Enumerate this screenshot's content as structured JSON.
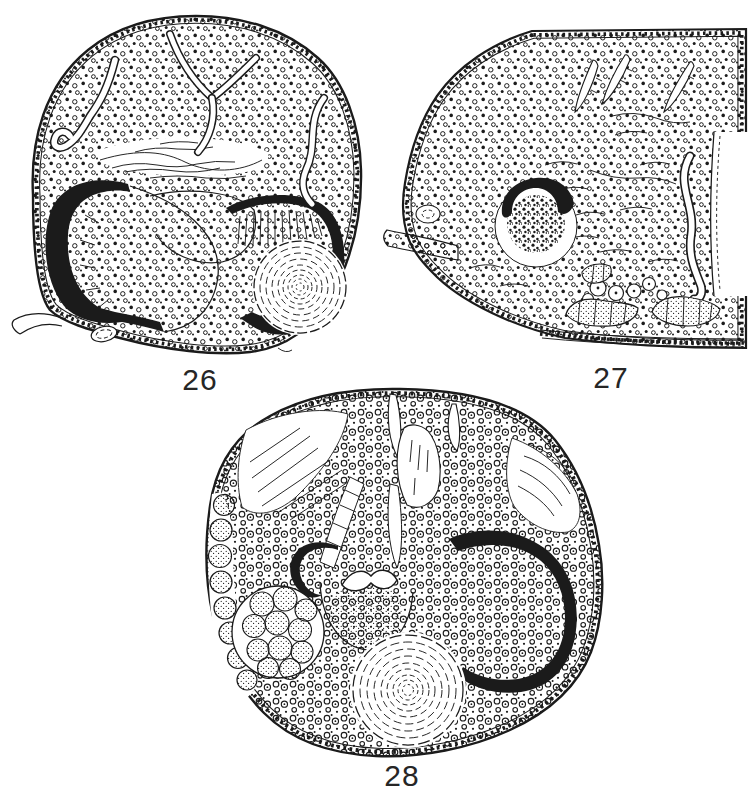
{
  "page": {
    "kind": "scientific figure plate of three ink-drawn cross sections",
    "background_color": "#ffffff",
    "ink_color": "#1b1b1b"
  },
  "figures": [
    {
      "label": "26",
      "alt": "rounded cross section with stippled cells, dark crescent on left, dark ring with radial striations and concentric-ringed sphere on right, folded canals at top"
    },
    {
      "label": "27",
      "alt": "partial cross section cut off at right edge, dark arc over a dense cell mass, sickle-shaped slits at top, curved canal at right, cell clusters along bottom"
    },
    {
      "label": "28",
      "alt": "large oval cross section with thick black C-shaped band at right, small dark crescent left of center, rosette of large cells, concentric-ringed sphere at bottom"
    }
  ]
}
